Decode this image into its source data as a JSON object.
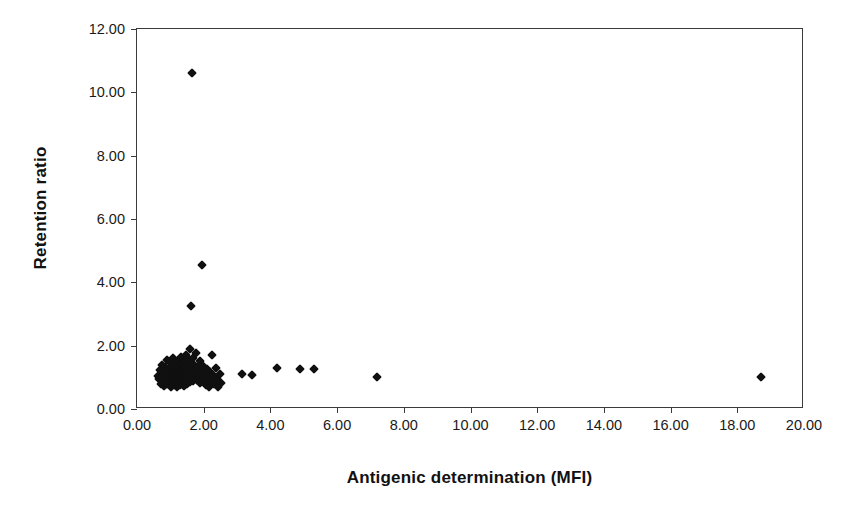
{
  "chart_data": {
    "type": "scatter",
    "title": "",
    "xlabel": "Antigenic determination (MFI)",
    "ylabel": "Retention ratio",
    "xlim": [
      0,
      20
    ],
    "ylim": [
      0,
      12
    ],
    "xticks": [
      "0.00",
      "2.00",
      "4.00",
      "6.00",
      "8.00",
      "10.00",
      "12.00",
      "14.00",
      "16.00",
      "18.00",
      "20.00"
    ],
    "xtick_values": [
      0,
      2,
      4,
      6,
      8,
      10,
      12,
      14,
      16,
      18,
      20
    ],
    "yticks": [
      "0.00",
      "2.00",
      "4.00",
      "6.00",
      "8.00",
      "10.00",
      "12.00"
    ],
    "ytick_values": [
      0,
      2,
      4,
      6,
      8,
      10,
      12
    ],
    "grid": false,
    "legend": false,
    "marker": "diamond",
    "marker_color": "#101010",
    "frame_color": "#3b3b3b",
    "background": "#ffffff",
    "series": [
      {
        "name": "samples",
        "points": [
          [
            1.65,
            10.6
          ],
          [
            1.95,
            4.55
          ],
          [
            1.62,
            3.25
          ],
          [
            0.62,
            1.05
          ],
          [
            0.66,
            0.95
          ],
          [
            0.7,
            1.22
          ],
          [
            0.72,
            0.8
          ],
          [
            0.75,
            1.4
          ],
          [
            0.78,
            1.0
          ],
          [
            0.8,
            1.15
          ],
          [
            0.82,
            0.72
          ],
          [
            0.84,
            1.33
          ],
          [
            0.86,
            0.92
          ],
          [
            0.88,
            1.08
          ],
          [
            0.9,
            1.55
          ],
          [
            0.91,
            0.78
          ],
          [
            0.93,
            1.18
          ],
          [
            0.95,
            0.98
          ],
          [
            0.96,
            1.3
          ],
          [
            0.98,
            0.85
          ],
          [
            1.0,
            1.12
          ],
          [
            1.01,
            1.45
          ],
          [
            1.02,
            0.68
          ],
          [
            1.03,
            1.02
          ],
          [
            1.05,
            1.25
          ],
          [
            1.06,
            0.88
          ],
          [
            1.07,
            1.6
          ],
          [
            1.08,
            1.1
          ],
          [
            1.09,
            0.95
          ],
          [
            1.1,
            1.35
          ],
          [
            1.11,
            0.75
          ],
          [
            1.12,
            1.05
          ],
          [
            1.13,
            1.2
          ],
          [
            1.14,
            0.9
          ],
          [
            1.15,
            1.48
          ],
          [
            1.16,
            1.0
          ],
          [
            1.17,
            0.82
          ],
          [
            1.18,
            1.28
          ],
          [
            1.19,
            1.13
          ],
          [
            1.2,
            0.7
          ],
          [
            1.21,
            1.4
          ],
          [
            1.22,
            0.98
          ],
          [
            1.23,
            1.16
          ],
          [
            1.24,
            1.52
          ],
          [
            1.25,
            0.86
          ],
          [
            1.26,
            1.07
          ],
          [
            1.27,
            1.32
          ],
          [
            1.28,
            0.76
          ],
          [
            1.29,
            1.22
          ],
          [
            1.3,
            1.0
          ],
          [
            1.31,
            1.65
          ],
          [
            1.32,
            0.92
          ],
          [
            1.33,
            1.18
          ],
          [
            1.34,
            1.44
          ],
          [
            1.35,
            0.8
          ],
          [
            1.36,
            1.1
          ],
          [
            1.37,
            1.26
          ],
          [
            1.38,
            0.96
          ],
          [
            1.39,
            1.38
          ],
          [
            1.4,
            0.72
          ],
          [
            1.41,
            1.05
          ],
          [
            1.42,
            1.5
          ],
          [
            1.43,
            1.15
          ],
          [
            1.44,
            0.88
          ],
          [
            1.45,
            1.3
          ],
          [
            1.46,
            1.02
          ],
          [
            1.47,
            1.72
          ],
          [
            1.48,
            0.94
          ],
          [
            1.49,
            1.2
          ],
          [
            1.5,
            1.42
          ],
          [
            1.51,
            0.78
          ],
          [
            1.52,
            1.08
          ],
          [
            1.53,
            1.58
          ],
          [
            1.54,
            1.25
          ],
          [
            1.55,
            0.9
          ],
          [
            1.56,
            1.12
          ],
          [
            1.57,
            1.36
          ],
          [
            1.58,
            1.0
          ],
          [
            1.59,
            0.84
          ],
          [
            1.6,
            1.9
          ],
          [
            1.61,
            1.18
          ],
          [
            1.62,
            1.46
          ],
          [
            1.63,
            0.97
          ],
          [
            1.64,
            1.28
          ],
          [
            1.66,
            1.06
          ],
          [
            1.67,
            1.62
          ],
          [
            1.68,
            0.88
          ],
          [
            1.7,
            1.22
          ],
          [
            1.72,
            1.4
          ],
          [
            1.74,
            1.0
          ],
          [
            1.76,
            1.78
          ],
          [
            1.78,
            1.14
          ],
          [
            1.8,
            0.92
          ],
          [
            1.82,
            1.32
          ],
          [
            1.85,
            1.08
          ],
          [
            1.88,
            1.52
          ],
          [
            1.9,
            0.82
          ],
          [
            1.92,
            1.2
          ],
          [
            1.95,
            1.05
          ],
          [
            1.98,
            1.36
          ],
          [
            2.0,
            0.95
          ],
          [
            2.03,
            1.15
          ],
          [
            2.06,
            0.75
          ],
          [
            2.1,
            1.25
          ],
          [
            2.12,
            1.0
          ],
          [
            2.15,
            0.7
          ],
          [
            2.18,
            1.18
          ],
          [
            2.22,
            0.9
          ],
          [
            2.25,
            1.72
          ],
          [
            2.28,
            1.08
          ],
          [
            2.32,
            0.78
          ],
          [
            2.36,
            1.3
          ],
          [
            2.4,
            0.95
          ],
          [
            2.44,
            0.68
          ],
          [
            2.48,
            1.12
          ],
          [
            2.52,
            0.82
          ],
          [
            3.15,
            1.1
          ],
          [
            3.45,
            1.08
          ],
          [
            4.2,
            1.3
          ],
          [
            4.9,
            1.25
          ],
          [
            5.3,
            1.25
          ],
          [
            7.2,
            1.0
          ],
          [
            18.7,
            1.0
          ]
        ]
      }
    ]
  }
}
